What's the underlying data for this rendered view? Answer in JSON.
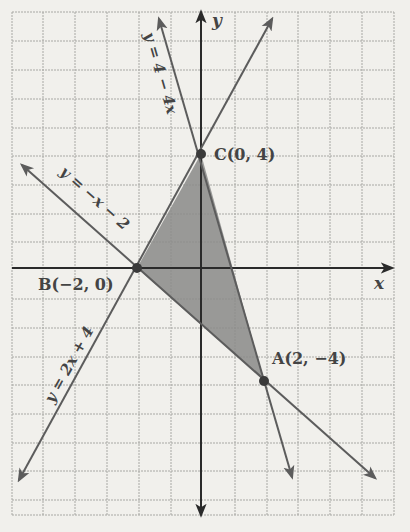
{
  "diagram": {
    "type": "coordinate-graph",
    "axes": {
      "x_label": "x",
      "y_label": "y",
      "origin_px": [
        201,
        268
      ],
      "unit_px": [
        32,
        28.5
      ],
      "x_range": [
        -6,
        6
      ],
      "y_range": [
        -8,
        9
      ]
    },
    "colors": {
      "background": "#f1f0ec",
      "grid": "#a8a8a4",
      "axis": "#2a2a2a",
      "line": "#5c5c5c",
      "shade": "#8a8a88",
      "label": "#444444"
    },
    "lines": [
      {
        "name": "line-y-eq-4-minus-4x",
        "equation": "y = 4 − 4x",
        "label": "y = 4 − 4x"
      },
      {
        "name": "line-y-eq-2x-plus-4",
        "equation": "y = 2x + 4",
        "label": "y = 2x + 4"
      },
      {
        "name": "line-y-eq-neg-x-minus-2",
        "equation": "y = −x − 2",
        "label": "y = −x − 2"
      }
    ],
    "points": [
      {
        "name": "A",
        "label": "A(2,  −4)",
        "x": 2,
        "y": -4
      },
      {
        "name": "B",
        "label": "B(−2, 0)",
        "x": -2,
        "y": 0
      },
      {
        "name": "C",
        "label": "C(0, 4)",
        "x": 0,
        "y": 4
      }
    ],
    "shaded_region": {
      "description": "Triangle ABC",
      "vertices": [
        "A",
        "B",
        "C"
      ]
    }
  }
}
